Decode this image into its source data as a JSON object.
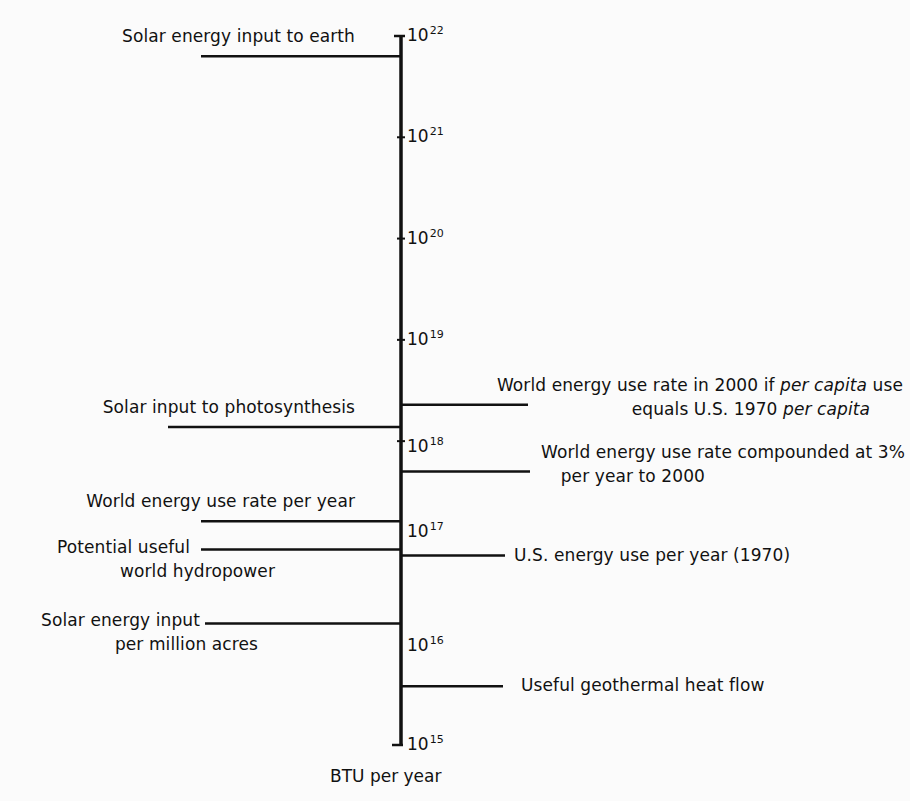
{
  "chart_data": {
    "type": "scale-diagram",
    "title": "",
    "axis": {
      "label": "BTU per year",
      "scale": "log10",
      "range": [
        1000000000000000.0,
        1e+22
      ],
      "ticks": [
        {
          "exp": 22,
          "label": "10",
          "sup": "22"
        },
        {
          "exp": 21,
          "label": "10",
          "sup": "21"
        },
        {
          "exp": 20,
          "label": "10",
          "sup": "20"
        },
        {
          "exp": 19,
          "label": "10",
          "sup": "19"
        },
        {
          "exp": 18,
          "label": "10",
          "sup": "18"
        },
        {
          "exp": 17,
          "label": "10",
          "sup": "17"
        },
        {
          "exp": 16,
          "label": "10",
          "sup": "16"
        },
        {
          "exp": 15,
          "label": "10",
          "sup": "15"
        }
      ]
    },
    "items": [
      {
        "name": "solar-energy-input-to-earth",
        "side": "left",
        "log10_value": 21.8,
        "value": 6e+21,
        "lines": [
          "Solar energy input to earth"
        ]
      },
      {
        "name": "world-use-2000-per-capita",
        "side": "right",
        "log10_value": 18.36,
        "value": 2.3e+18,
        "lines": [
          "World energy use rate in 2000 if |per capita| use",
          "equals U.S. 1970 |per capita|"
        ]
      },
      {
        "name": "solar-input-photosynthesis",
        "side": "left",
        "log10_value": 18.14,
        "value": 1.4e+18,
        "lines": [
          "Solar input to photosynthesis"
        ]
      },
      {
        "name": "world-use-compounded-3pct",
        "side": "right",
        "log10_value": 17.7,
        "value": 5e+17,
        "lines": [
          "World energy use rate compounded at 3%",
          "per year to 2000"
        ]
      },
      {
        "name": "world-energy-use-per-year",
        "side": "left",
        "log10_value": 17.21,
        "value": 1.6e+17,
        "lines": [
          "World energy use rate per year"
        ]
      },
      {
        "name": "potential-world-hydropower",
        "side": "left",
        "log10_value": 16.93,
        "value": 8.5e+16,
        "lines": [
          "Potential useful",
          "world hydropower"
        ]
      },
      {
        "name": "us-energy-use-1970",
        "side": "right",
        "log10_value": 16.87,
        "value": 7e+16,
        "lines": [
          "U.S. energy use per year (1970)"
        ]
      },
      {
        "name": "solar-input-per-million-acres",
        "side": "left",
        "log10_value": 16.2,
        "value": 1.6e+16,
        "lines": [
          "Solar energy input",
          "per million acres"
        ]
      },
      {
        "name": "useful-geothermal-heat-flow",
        "side": "right",
        "log10_value": 15.58,
        "value": 3800000000000000.0,
        "lines": [
          "Useful geothermal heat flow"
        ]
      }
    ]
  }
}
